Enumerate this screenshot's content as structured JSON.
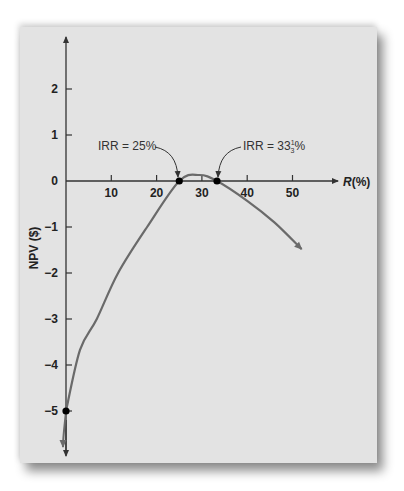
{
  "chart_data": {
    "type": "line",
    "title": "",
    "xlabel": "R(%)",
    "ylabel": "NPV ($)",
    "xlim": [
      0,
      58
    ],
    "ylim": [
      -6,
      3
    ],
    "grid": false,
    "x_ticks": [
      10,
      20,
      30,
      40,
      50
    ],
    "y_ticks": [
      2,
      1,
      0,
      -1,
      -2,
      -3,
      -4,
      -5
    ],
    "x_tick_labels": [
      "10",
      "20",
      "30",
      "40",
      "50"
    ],
    "y_tick_labels": [
      "2",
      "1",
      "0",
      "−1",
      "−2",
      "−3",
      "−4",
      "−5"
    ],
    "series": [
      {
        "name": "NPV profile",
        "color": "#6a6a6a",
        "x": [
          0,
          3.1,
          6.8,
          11.5,
          17.9,
          25,
          29.4,
          33.33,
          40,
          46,
          52
        ],
        "y": [
          -5,
          -3.67,
          -3,
          -2,
          -1,
          0,
          0.13,
          0,
          -0.43,
          -0.9,
          -1.48
        ]
      }
    ],
    "highlight_points": [
      {
        "x": 0,
        "y": -5
      },
      {
        "x": 25,
        "y": 0
      },
      {
        "x": 33.33,
        "y": 0
      }
    ],
    "annotations": [
      {
        "text": "IRR = 25%",
        "points_to": {
          "x": 25,
          "y": 0
        }
      },
      {
        "text": "IRR = 33",
        "fraction_num": "1",
        "fraction_den": "3",
        "suffix": "%",
        "points_to": {
          "x": 33.33,
          "y": 0
        }
      }
    ],
    "colors": {
      "panel": "#e3e3e3",
      "axis": "#333333",
      "curve": "#6a6a6a",
      "point": "#000000"
    }
  }
}
